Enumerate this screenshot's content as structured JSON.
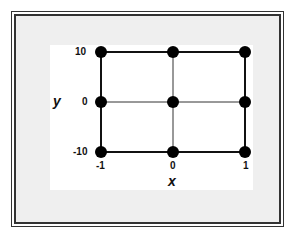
{
  "diagram": {
    "x_axis": {
      "title": "x",
      "ticks": [
        "-1",
        "0",
        "1"
      ]
    },
    "y_axis": {
      "title": "y",
      "ticks": [
        "10",
        "0",
        "-10"
      ]
    },
    "grid_points": [
      {
        "x": -1,
        "y": 10
      },
      {
        "x": 0,
        "y": 10
      },
      {
        "x": 1,
        "y": 10
      },
      {
        "x": -1,
        "y": 0
      },
      {
        "x": 0,
        "y": 0
      },
      {
        "x": 1,
        "y": 0
      },
      {
        "x": -1,
        "y": -10
      },
      {
        "x": 0,
        "y": -10
      },
      {
        "x": 1,
        "y": -10
      }
    ],
    "colors": {
      "frame_background": "#efefef",
      "panel_background": "#ffffff",
      "lines": "#111111",
      "points": "#000000"
    }
  }
}
